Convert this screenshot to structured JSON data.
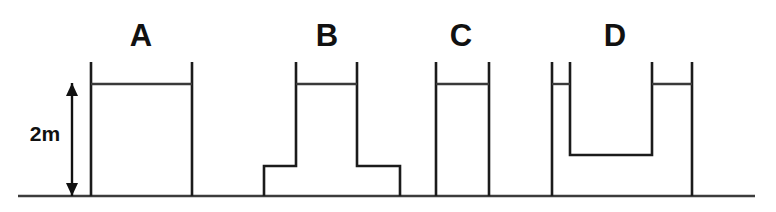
{
  "figure": {
    "background_color": "#ffffff",
    "line_color": "#1b1b1b",
    "ground_color": "#3c3c3c",
    "water_color": "#3a3a3a",
    "width": 776,
    "height": 212
  },
  "dimension": {
    "label": "2m",
    "value": 2,
    "unit": "m",
    "label_x": 45,
    "label_y": 141,
    "arrow_x": 72,
    "arrow_top_y": 83,
    "arrow_bottom_y": 196,
    "arrow_name": "double-headed-arrow-icon"
  },
  "ground": {
    "name": "ground-line",
    "y": 196,
    "x_start": 18,
    "x_end": 755
  },
  "water_level": {
    "y": 84,
    "wall_top_y": 62
  },
  "vessels": [
    {
      "id": "A",
      "label": "A",
      "label_x": 141,
      "label_y": 46,
      "shape": "rectangular-column",
      "outline": "M 91,196 L 91,62 M 192,62 L 192,196",
      "water_line": "M 91,84 L 192,84",
      "left_wall_x": 91,
      "right_wall_x": 192,
      "width_m": 101
    },
    {
      "id": "B",
      "label": "B",
      "label_x": 327,
      "label_y": 46,
      "shape": "t-shape-flared-base",
      "outline": "M 264,196 L 264,166 L 296,166 L 296,62 M 357,62 L 357,166 L 400,166 L 400,196",
      "water_line": "M 296,84 L 357,84",
      "base_left_x": 264,
      "base_right_x": 400,
      "column_left_x": 296,
      "column_right_x": 357,
      "shoulder_y": 166
    },
    {
      "id": "C",
      "label": "C",
      "label_x": 461,
      "label_y": 46,
      "shape": "narrow-rectangular-column",
      "outline": "M 436,196 L 436,62 M 489,62 L 489,196",
      "water_line": "M 436,84 L 489,84",
      "left_wall_x": 436,
      "right_wall_x": 489,
      "width_m": 53
    },
    {
      "id": "D",
      "label": "D",
      "label_x": 615,
      "label_y": 46,
      "shape": "u-shape-raised-center-block",
      "outline": "M 552,196 L 552,62 M 570,62 L 570,155 L 652,155 L 652,62 M 692,62 L 692,196",
      "water_line_left": "M 552,84 L 570,84",
      "water_line_right": "M 652,84 L 692,84",
      "outer_left_x": 552,
      "inner_left_x": 570,
      "inner_right_x": 652,
      "outer_right_x": 692,
      "block_top_y": 155
    }
  ]
}
